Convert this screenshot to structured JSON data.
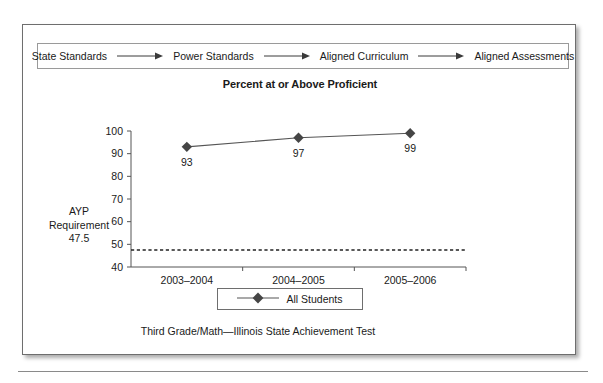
{
  "figure": {
    "flow": {
      "steps": [
        "State Standards",
        "Power Standards",
        "Aligned Curriculum",
        "Aligned Assessments"
      ],
      "arrow_icon": "right-arrow-icon"
    },
    "chart_title": "Percent at or Above Proficient",
    "caption": "Third Grade/Math—Illinois State Achievement Test",
    "annotation": {
      "line1": "AYP",
      "line2": "Requirement",
      "line3": "47.5"
    },
    "legend": {
      "label": "All Students",
      "marker": "diamond-marker-icon"
    }
  },
  "chart_data": {
    "type": "line",
    "title": "Percent at or Above Proficient",
    "categories": [
      "2003–2004",
      "2004–2005",
      "2005–2006"
    ],
    "series": [
      {
        "name": "All Students",
        "values": [
          93,
          97,
          99
        ]
      }
    ],
    "point_labels": [
      "93",
      "97",
      "99"
    ],
    "ylim": [
      40,
      100
    ],
    "yticks": [
      40,
      50,
      60,
      70,
      80,
      90,
      100
    ],
    "ytick_labels": [
      "40",
      "50",
      "60",
      "70",
      "80",
      "90",
      "100"
    ],
    "xlabel": "",
    "ylabel": "",
    "grid": false,
    "legend_position": "bottom",
    "annotations": [
      {
        "type": "threshold-line",
        "label": "AYP Requirement 47.5",
        "value": 47.5,
        "style": "dashed"
      }
    ],
    "colors": {
      "marker": "#454545",
      "line": "#555555",
      "axis": "#555555",
      "threshold": "#222222"
    }
  }
}
